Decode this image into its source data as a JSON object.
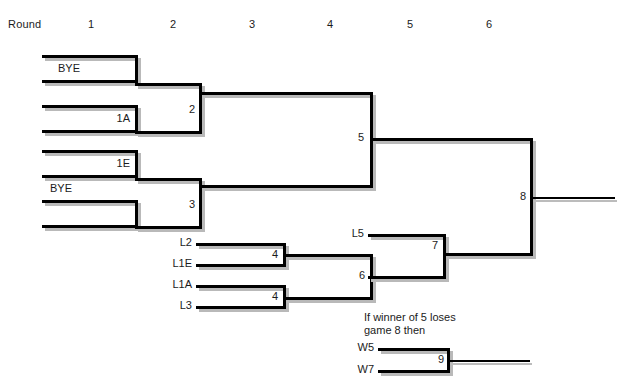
{
  "header": {
    "round_word": "Round",
    "rounds": [
      "1",
      "2",
      "3",
      "4",
      "5",
      "6"
    ]
  },
  "upper_bracket": {
    "round1": [
      {
        "id": "m1",
        "label": "BYE",
        "align": "left"
      },
      {
        "id": "m2",
        "label": "1A",
        "align": "right"
      },
      {
        "id": "m3",
        "label": "1E",
        "align": "right"
      },
      {
        "id": "m4",
        "label": "BYE",
        "align": "left"
      }
    ],
    "round2": [
      {
        "id": "g2",
        "number": "2"
      },
      {
        "id": "g3",
        "number": "3"
      }
    ],
    "round3": [
      {
        "id": "g5",
        "number": "5"
      }
    ],
    "final": [
      {
        "id": "g8",
        "number": "8"
      }
    ]
  },
  "lower_bracket": {
    "feeders": [
      {
        "id": "l2",
        "label": "L2"
      },
      {
        "id": "l1e",
        "label": "L1E"
      },
      {
        "id": "l1a",
        "label": "L1A"
      },
      {
        "id": "l3",
        "label": "L3"
      },
      {
        "id": "l5",
        "label": "L5"
      }
    ],
    "games": [
      {
        "id": "g4a",
        "number": "4"
      },
      {
        "id": "g4b",
        "number": "4"
      },
      {
        "id": "g6",
        "number": "6"
      },
      {
        "id": "g7",
        "number": "7"
      }
    ]
  },
  "ifnecessary": {
    "note": "If winner of 5 loses\ngame 8 then",
    "feeders": [
      {
        "id": "w5",
        "label": "W5"
      },
      {
        "id": "w7",
        "label": "W7"
      }
    ],
    "games": [
      {
        "id": "g9",
        "number": "9"
      }
    ]
  },
  "colors": {
    "line": "#000000",
    "shadow": "#b9b9b9",
    "text": "#1b1b1b",
    "background": "#ffffff"
  }
}
